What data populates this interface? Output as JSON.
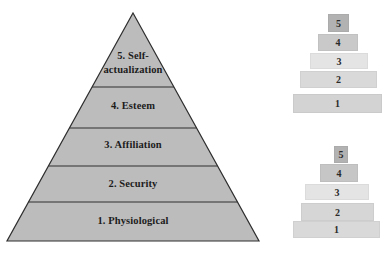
{
  "main_pyramid": {
    "fill_color": "#bcbcbc",
    "outline_color": "#2e2e2e",
    "levels": [
      {
        "number": "5",
        "label": "5. Self-actualization"
      },
      {
        "number": "4",
        "label": "4. Esteem"
      },
      {
        "number": "3",
        "label": "3. Affiliation"
      },
      {
        "number": "2",
        "label": "2. Security"
      },
      {
        "number": "1",
        "label": "1. Physiological"
      }
    ]
  },
  "mini_pyramid_top": {
    "blocks": [
      {
        "label": "5",
        "color": "#b2b2b2"
      },
      {
        "label": "4",
        "color": "#c9c9c9"
      },
      {
        "label": "3",
        "color": "#e4e4e4"
      },
      {
        "label": "2",
        "color": "#d9d9d9"
      },
      {
        "label": "1",
        "color": "#d3d3d3"
      }
    ]
  },
  "mini_pyramid_bottom": {
    "blocks": [
      {
        "label": "5",
        "color": "#b2b2b2"
      },
      {
        "label": "4",
        "color": "#c6c6c6"
      },
      {
        "label": "3",
        "color": "#e4e4e4"
      },
      {
        "label": "2",
        "color": "#d6d6d6"
      },
      {
        "label": "1",
        "color": "#d9d9d9"
      }
    ]
  }
}
